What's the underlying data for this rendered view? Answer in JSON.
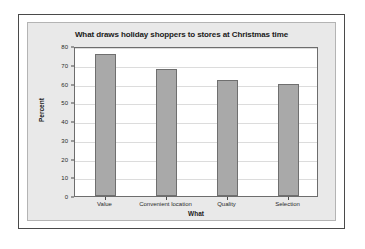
{
  "chart_data": {
    "type": "bar",
    "title": "What draws holiday shoppers to stores at Christmas time",
    "xlabel": "What",
    "ylabel": "Percent",
    "categories": [
      "Value",
      "Convenient location",
      "Quality",
      "Selection"
    ],
    "values": [
      76,
      68,
      62,
      60
    ],
    "ylim": [
      0,
      80
    ],
    "ytick_labels": [
      "0",
      "10",
      "20",
      "30",
      "40",
      "50",
      "60",
      "70",
      "80"
    ],
    "ytick_values": [
      0,
      10,
      20,
      30,
      40,
      50,
      60,
      70,
      80
    ],
    "grid": "horizontal",
    "legend": "none",
    "bar_color": "#a9a9a9",
    "bar_border_color": "#6f6f6f",
    "panel_color": "#e9e9e9",
    "plot_background": "#ffffff",
    "gridline_color": "#dcdcdc",
    "axis_color": "#6d6d6d"
  }
}
